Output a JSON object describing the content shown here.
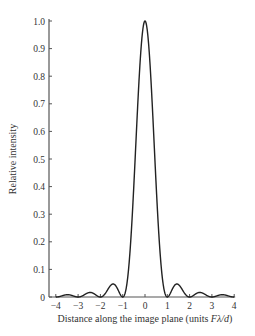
{
  "chart_data": {
    "type": "line",
    "title": "",
    "xlabel": "Distance along the image plane (units Fλ/d)",
    "xlabel_parts": {
      "prefix": "Distance along the image plane (units ",
      "italic": "Fλ/d",
      "suffix": ")"
    },
    "ylabel": "Relative intensity",
    "xlim": [
      -4,
      4
    ],
    "ylim": [
      0,
      1.0
    ],
    "grid": false,
    "legend": "none",
    "x_ticks": [
      "−4",
      "−3",
      "−2",
      "−1",
      "0",
      "1",
      "2",
      "3",
      "4"
    ],
    "y_ticks": [
      "0",
      "0.1",
      "0.2",
      "0.3",
      "0.4",
      "0.5",
      "0.6",
      "0.7",
      "0.8",
      "0.9",
      "1.0"
    ],
    "series": [
      {
        "name": "sinc^2 intensity",
        "function": "(sin(pi x)/(pi x))^2",
        "x": [
          -4,
          -3.5,
          -3,
          -2.46,
          -2,
          -1.43,
          -1,
          -0.75,
          -0.5,
          -0.25,
          0,
          0.25,
          0.5,
          0.75,
          1,
          1.43,
          2,
          2.46,
          3,
          3.5,
          4
        ],
        "values": [
          0,
          0.008,
          0,
          0.016,
          0,
          0.047,
          0,
          0.16,
          0.405,
          0.811,
          1.0,
          0.811,
          0.405,
          0.16,
          0,
          0.047,
          0,
          0.016,
          0,
          0.008,
          0
        ]
      }
    ]
  }
}
